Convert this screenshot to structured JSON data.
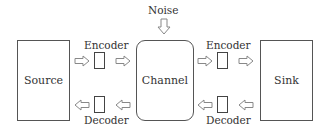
{
  "diagram": {
    "nodes": {
      "source": "Source",
      "channel": "Channel",
      "sink": "Sink",
      "noise": "Noise"
    },
    "left_link": {
      "encoder_label": "Encoder",
      "decoder_label": "Decoder"
    },
    "right_link": {
      "encoder_label": "Encoder",
      "decoder_label": "Decoder"
    },
    "edges": [
      {
        "from": "Source",
        "to": "Encoder (left)",
        "direction": "right"
      },
      {
        "from": "Encoder (left)",
        "to": "Channel",
        "direction": "right"
      },
      {
        "from": "Channel",
        "to": "Decoder (left)",
        "direction": "left"
      },
      {
        "from": "Decoder (left)",
        "to": "Source",
        "direction": "left"
      },
      {
        "from": "Channel",
        "to": "Encoder (right)",
        "direction": "right"
      },
      {
        "from": "Encoder (right)",
        "to": "Sink",
        "direction": "right"
      },
      {
        "from": "Sink",
        "to": "Decoder (right)",
        "direction": "left"
      },
      {
        "from": "Decoder (right)",
        "to": "Channel",
        "direction": "left"
      },
      {
        "from": "Noise",
        "to": "Channel",
        "direction": "down"
      }
    ],
    "colors": {
      "stroke": "#555555",
      "arrow_stroke": "#888888",
      "text": "#333333",
      "background": "#ffffff"
    }
  }
}
